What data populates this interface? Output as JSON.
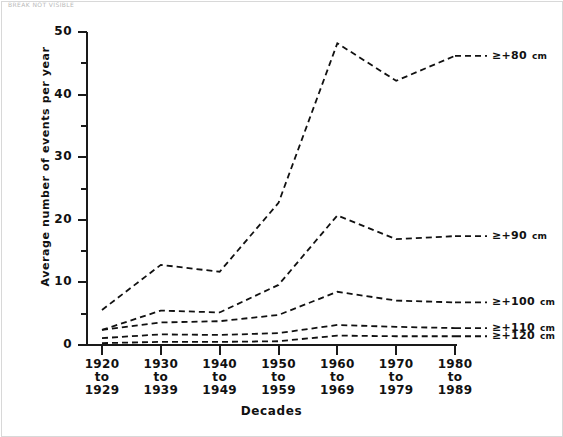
{
  "topnote": "BREAK NOT VISIBLE",
  "chart_data": {
    "type": "line",
    "title": "",
    "xlabel": "Decades",
    "ylabel": "Average number of events per year",
    "categories": [
      "1920 to 1929",
      "1930 to 1939",
      "1940 to 1949",
      "1950 to 1959",
      "1960 to 1969",
      "1970 to 1979",
      "1980 to 1989"
    ],
    "category_lines": [
      [
        "1920",
        "to",
        "1929"
      ],
      [
        "1930",
        "to",
        "1939"
      ],
      [
        "1940",
        "to",
        "1949"
      ],
      [
        "1950",
        "to",
        "1959"
      ],
      [
        "1960",
        "to",
        "1969"
      ],
      [
        "1970",
        "to",
        "1979"
      ],
      [
        "1980",
        "to",
        "1989"
      ]
    ],
    "ylim": [
      0,
      50
    ],
    "yticks": [
      0,
      10,
      20,
      30,
      40,
      50
    ],
    "yminorticks": [
      5,
      15,
      25,
      35,
      45
    ],
    "grid": false,
    "legend_position": "right-inline",
    "linestyle": "dashed",
    "color": "#111111",
    "series": [
      {
        "name": "≥+80",
        "unit": "cm",
        "values": [
          5.6,
          12.8,
          11.7,
          22.7,
          48.2,
          42.2,
          46.2
        ]
      },
      {
        "name": "≥+90",
        "unit": "cm",
        "values": [
          2.4,
          5.5,
          5.2,
          9.6,
          20.7,
          16.9,
          17.4
        ]
      },
      {
        "name": "≥+100",
        "unit": "cm",
        "values": [
          2.4,
          3.6,
          3.8,
          4.8,
          8.5,
          7.1,
          6.8
        ]
      },
      {
        "name": "≥+110",
        "unit": "cm",
        "values": [
          1.1,
          1.7,
          1.6,
          1.9,
          3.2,
          2.9,
          2.7
        ]
      },
      {
        "name": "≥+120",
        "unit": "cm",
        "values": [
          0.3,
          0.5,
          0.5,
          0.6,
          1.5,
          1.4,
          1.4
        ]
      }
    ]
  }
}
